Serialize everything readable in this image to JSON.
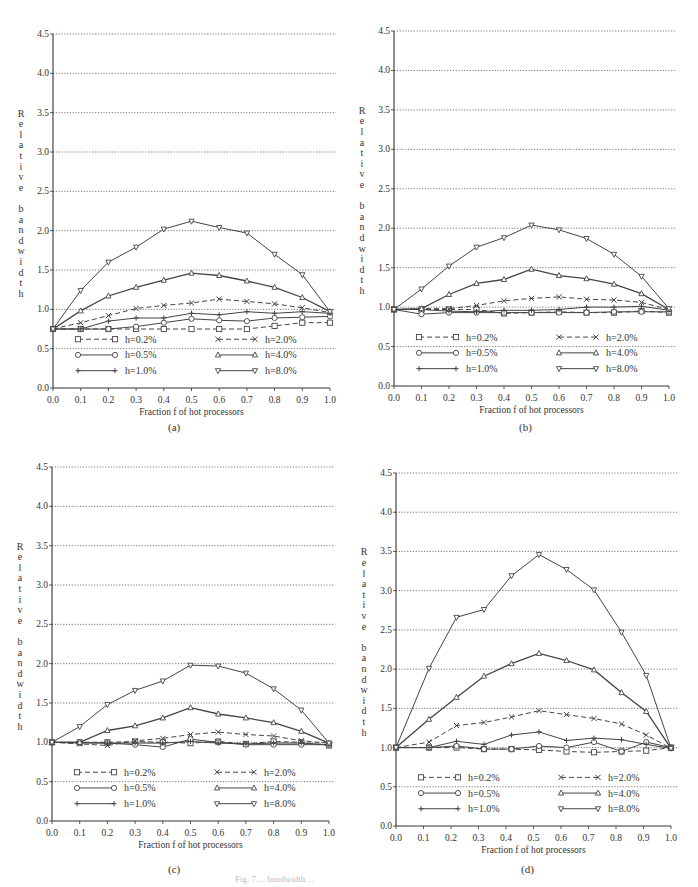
{
  "figure": {
    "caption": "Fig. 7 ... bandwidth ...",
    "panels": [
      {
        "label": "(a)"
      },
      {
        "label": "(b)"
      },
      {
        "label": "(c)"
      },
      {
        "label": "(d)"
      }
    ]
  },
  "chart_data": [
    {
      "panel": "(a)",
      "type": "line",
      "title": "",
      "xlabel": "Fraction f of hot processors",
      "ylabel": "Relative bandwidth",
      "xlim": [
        0.0,
        1.0
      ],
      "ylim": [
        0.0,
        4.5
      ],
      "xticks": [
        "0.0",
        "0.1",
        "0.2",
        "0.3",
        "0.4",
        "0.5",
        "0.6",
        "0.7",
        "0.8",
        "0.9",
        "1.0"
      ],
      "yticks": [
        "0.0",
        "0.5",
        "1.0",
        "1.5",
        "2.0",
        "2.5",
        "3.0",
        "3.5",
        "4.0",
        "4.5"
      ],
      "grid": "horizontal dotted",
      "legend_position": "bottom inside, 2 columns",
      "x": [
        0.0,
        0.1,
        0.2,
        0.3,
        0.4,
        0.5,
        0.6,
        0.7,
        0.8,
        0.9,
        1.0
      ],
      "series": [
        {
          "name": "h=0.2%",
          "marker": "square",
          "dash": true,
          "values": [
            0.75,
            0.75,
            0.75,
            0.75,
            0.75,
            0.75,
            0.75,
            0.75,
            0.79,
            0.83,
            0.83
          ]
        },
        {
          "name": "h=0.5%",
          "marker": "circle",
          "dash": false,
          "values": [
            0.75,
            0.75,
            0.75,
            0.78,
            0.83,
            0.88,
            0.86,
            0.85,
            0.89,
            0.9,
            0.91
          ]
        },
        {
          "name": "h=1.0%",
          "marker": "plus",
          "dash": false,
          "values": [
            0.75,
            0.75,
            0.85,
            0.89,
            0.89,
            0.95,
            0.93,
            0.97,
            0.95,
            0.97,
            0.95
          ]
        },
        {
          "name": "h=2.0%",
          "marker": "cross",
          "dash": true,
          "values": [
            0.75,
            0.83,
            0.92,
            1.01,
            1.05,
            1.08,
            1.13,
            1.1,
            1.07,
            1.02,
            0.96
          ]
        },
        {
          "name": "h=4.0%",
          "marker": "triangle-up",
          "dash": false,
          "values": [
            0.75,
            0.98,
            1.17,
            1.28,
            1.37,
            1.46,
            1.43,
            1.36,
            1.28,
            1.15,
            0.97
          ]
        },
        {
          "name": "h=8.0%",
          "marker": "triangle-down",
          "dash": false,
          "values": [
            0.75,
            1.24,
            1.6,
            1.79,
            2.02,
            2.12,
            2.04,
            1.97,
            1.7,
            1.44,
            0.97
          ]
        }
      ]
    },
    {
      "panel": "(b)",
      "type": "line",
      "title": "",
      "xlabel": "Fraction f of hot processors",
      "ylabel": "Relative bandwidth",
      "xlim": [
        0.0,
        1.0
      ],
      "ylim": [
        0.0,
        4.5
      ],
      "xticks": [
        "0.0",
        "0.1",
        "0.2",
        "0.3",
        "0.4",
        "0.5",
        "0.6",
        "0.7",
        "0.8",
        "0.9",
        "1.0"
      ],
      "yticks": [
        "0.0",
        "0.5",
        "1.0",
        "1.5",
        "2.0",
        "2.5",
        "3.0",
        "3.5",
        "4.0",
        "4.5"
      ],
      "grid": "horizontal dotted",
      "legend_position": "bottom inside, 2 columns",
      "x": [
        0.0,
        0.1,
        0.2,
        0.3,
        0.4,
        0.5,
        0.6,
        0.7,
        0.8,
        0.9,
        1.0
      ],
      "series": [
        {
          "name": "h=0.2%",
          "marker": "square",
          "dash": true,
          "values": [
            0.97,
            0.97,
            0.97,
            0.97,
            0.92,
            0.93,
            0.94,
            0.93,
            0.93,
            0.95,
            0.93
          ]
        },
        {
          "name": "h=0.5%",
          "marker": "circle",
          "dash": false,
          "values": [
            0.97,
            0.91,
            0.93,
            0.93,
            0.93,
            0.93,
            0.93,
            0.93,
            0.94,
            0.94,
            0.94
          ]
        },
        {
          "name": "h=1.0%",
          "marker": "plus",
          "dash": false,
          "values": [
            0.97,
            0.97,
            0.95,
            0.94,
            0.96,
            0.96,
            0.97,
            1.0,
            1.0,
            1.01,
            0.96
          ]
        },
        {
          "name": "h=2.0%",
          "marker": "cross",
          "dash": true,
          "values": [
            0.97,
            0.98,
            0.98,
            1.02,
            1.08,
            1.11,
            1.13,
            1.1,
            1.09,
            1.06,
            0.97
          ]
        },
        {
          "name": "h=4.0%",
          "marker": "triangle-up",
          "dash": false,
          "values": [
            0.97,
            0.98,
            1.16,
            1.3,
            1.35,
            1.48,
            1.4,
            1.36,
            1.29,
            1.17,
            0.97
          ]
        },
        {
          "name": "h=8.0%",
          "marker": "triangle-down",
          "dash": false,
          "values": [
            0.97,
            1.23,
            1.52,
            1.76,
            1.88,
            2.04,
            1.98,
            1.87,
            1.67,
            1.39,
            0.98
          ]
        }
      ]
    },
    {
      "panel": "(c)",
      "type": "line",
      "title": "",
      "xlabel": "Fraction f of hot processors",
      "ylabel": "Relative bandwidth",
      "xlim": [
        0.0,
        1.0
      ],
      "ylim": [
        0.0,
        4.5
      ],
      "xticks": [
        "0.0",
        "0.1",
        "0.2",
        "0.3",
        "0.4",
        "0.5",
        "0.6",
        "0.7",
        "0.8",
        "0.9",
        "1.0"
      ],
      "yticks": [
        "0.0",
        "0.5",
        "1.0",
        "1.5",
        "2.0",
        "2.5",
        "3.0",
        "3.5",
        "4.0",
        "4.5"
      ],
      "grid": "horizontal dotted",
      "legend_position": "bottom inside, 2 columns",
      "x": [
        0.0,
        0.1,
        0.2,
        0.3,
        0.4,
        0.5,
        0.6,
        0.7,
        0.8,
        0.9,
        1.0
      ],
      "series": [
        {
          "name": "h=0.2%",
          "marker": "square",
          "dash": true,
          "values": [
            1.0,
            1.0,
            1.0,
            1.01,
            1.0,
            0.99,
            1.01,
            0.98,
            1.01,
            1.0,
            0.96
          ]
        },
        {
          "name": "h=0.5%",
          "marker": "circle",
          "dash": false,
          "values": [
            1.0,
            0.99,
            0.99,
            0.97,
            0.94,
            1.04,
            1.0,
            0.97,
            0.97,
            0.97,
            0.97
          ]
        },
        {
          "name": "h=1.0%",
          "marker": "plus",
          "dash": false,
          "values": [
            1.0,
            1.0,
            0.99,
            0.99,
            0.99,
            1.01,
            0.99,
            0.98,
            0.99,
            0.99,
            0.97
          ]
        },
        {
          "name": "h=2.0%",
          "marker": "cross",
          "dash": true,
          "values": [
            1.0,
            0.98,
            0.96,
            1.02,
            1.05,
            1.1,
            1.13,
            1.1,
            1.08,
            1.02,
            0.99
          ]
        },
        {
          "name": "h=4.0%",
          "marker": "triangle-up",
          "dash": false,
          "values": [
            1.0,
            1.0,
            1.15,
            1.21,
            1.31,
            1.44,
            1.36,
            1.31,
            1.25,
            1.14,
            0.99
          ]
        },
        {
          "name": "h=8.0%",
          "marker": "triangle-down",
          "dash": false,
          "values": [
            1.0,
            1.2,
            1.48,
            1.66,
            1.78,
            1.98,
            1.97,
            1.88,
            1.68,
            1.41,
            0.99
          ]
        }
      ]
    },
    {
      "panel": "(d)",
      "type": "line",
      "title": "",
      "xlabel": "Fraction f of hot processors",
      "ylabel": "Relative bandwidth",
      "xlim": [
        0.0,
        1.0
      ],
      "ylim": [
        0.0,
        4.5
      ],
      "xticks": [
        "0.0",
        "0.1",
        "0.2",
        "0.3",
        "0.4",
        "0.5",
        "0.6",
        "0.7",
        "0.8",
        "0.9",
        "1.0"
      ],
      "yticks": [
        "0.0",
        "0.5",
        "1.0",
        "1.5",
        "2.0",
        "2.5",
        "3.0",
        "3.5",
        "4.0",
        "4.5"
      ],
      "grid": "horizontal dotted",
      "legend_position": "bottom inside, 2 columns",
      "x": [
        0.0,
        0.12,
        0.22,
        0.32,
        0.42,
        0.52,
        0.62,
        0.72,
        0.82,
        0.91,
        1.0
      ],
      "series": [
        {
          "name": "h=0.2%",
          "marker": "square",
          "dash": true,
          "values": [
            1.0,
            1.0,
            1.0,
            0.98,
            0.98,
            0.97,
            0.95,
            0.94,
            0.95,
            0.96,
            1.0
          ]
        },
        {
          "name": "h=0.5%",
          "marker": "circle",
          "dash": false,
          "values": [
            1.0,
            1.0,
            1.02,
            0.98,
            0.98,
            1.02,
            1.0,
            1.07,
            0.95,
            1.07,
            1.0
          ]
        },
        {
          "name": "h=1.0%",
          "marker": "plus",
          "dash": false,
          "values": [
            1.0,
            1.0,
            1.08,
            1.04,
            1.16,
            1.2,
            1.09,
            1.12,
            1.1,
            1.04,
            0.99
          ]
        },
        {
          "name": "h=2.0%",
          "marker": "cross",
          "dash": true,
          "values": [
            1.0,
            1.07,
            1.28,
            1.32,
            1.39,
            1.47,
            1.42,
            1.37,
            1.3,
            1.16,
            0.99
          ]
        },
        {
          "name": "h=4.0%",
          "marker": "triangle-up",
          "dash": false,
          "values": [
            1.0,
            1.36,
            1.64,
            1.91,
            2.07,
            2.2,
            2.11,
            1.99,
            1.7,
            1.46,
            0.99
          ]
        },
        {
          "name": "h=8.0%",
          "marker": "triangle-down",
          "dash": false,
          "values": [
            1.0,
            2.01,
            2.66,
            2.76,
            3.19,
            3.46,
            3.27,
            3.01,
            2.47,
            1.92,
            0.99
          ]
        }
      ]
    }
  ],
  "layout_colors": {
    "axis": "#333333",
    "grid": "#555555",
    "line": "#444444"
  }
}
